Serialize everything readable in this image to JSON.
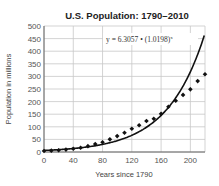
{
  "chart_data": {
    "type": "scatter",
    "title": "U.S. Population: 1790–2010",
    "xlabel": "Years since 1790",
    "ylabel": "Population in millions",
    "xlim": [
      0,
      220
    ],
    "ylim": [
      0,
      500
    ],
    "x_ticks": [
      0,
      40,
      80,
      120,
      160,
      200
    ],
    "y_ticks": [
      0,
      50,
      100,
      150,
      200,
      250,
      300,
      350,
      400,
      450,
      500
    ],
    "grid": true,
    "series": [
      {
        "name": "Census data",
        "kind": "scatter",
        "marker": "diamond",
        "x": [
          0,
          10,
          20,
          30,
          40,
          50,
          60,
          70,
          80,
          90,
          100,
          110,
          120,
          130,
          140,
          150,
          160,
          170,
          180,
          190,
          200,
          210,
          220
        ],
        "values": [
          3.9,
          5.3,
          7.2,
          9.6,
          12.9,
          17.1,
          23.2,
          31.4,
          38.6,
          50.2,
          63.0,
          76.2,
          92.2,
          106.0,
          123.2,
          132.2,
          151.3,
          179.3,
          203.2,
          226.5,
          248.7,
          281.4,
          308.7
        ]
      },
      {
        "name": "Exponential model",
        "kind": "line",
        "equation": "y = 6.3057 • (1.0198)^x",
        "a": 6.3057,
        "b": 1.0198
      }
    ],
    "annotations": [
      {
        "text": "y = 6.3057 • (1.0198)",
        "superscript": "x"
      }
    ]
  },
  "labels": {
    "title": "U.S. Population: 1790–2010",
    "xlabel": "Years since 1790",
    "ylabel": "Population in millions",
    "equation": "y = 6.3057 • (1.0198)",
    "equation_sup": "x"
  }
}
